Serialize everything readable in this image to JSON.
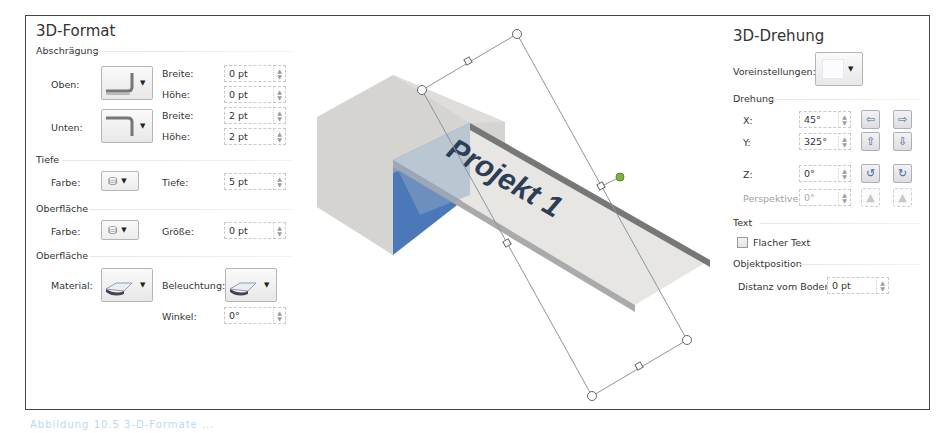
{
  "left_panel": {
    "title": "3D-Format",
    "bevel": {
      "section": "Abschrägung",
      "top_label": "Oben:",
      "bottom_label": "Unten:",
      "top_width_label": "Breite:",
      "top_width_value": "0 pt",
      "top_height_label": "Höhe:",
      "top_height_value": "0 pt",
      "bottom_width_label": "Breite:",
      "bottom_width_value": "2 pt",
      "bottom_height_label": "Höhe:",
      "bottom_height_value": "2 pt"
    },
    "depth": {
      "section": "Tiefe",
      "color_label": "Farbe:",
      "depth_label": "Tiefe:",
      "depth_value": "5 pt"
    },
    "contour": {
      "section": "Oberfläche",
      "color_label": "Farbe:",
      "size_label": "Größe:",
      "size_value": "0 pt"
    },
    "surface": {
      "section": "Oberfläche",
      "material_label": "Material:",
      "lighting_label": "Beleuchtung:",
      "angle_label": "Winkel:",
      "angle_value": "0°"
    }
  },
  "preview": {
    "text": "Projekt 1",
    "colors": {
      "cube": "#d8d6d3",
      "blue": "#4a78b8",
      "ramp": "#e9e7e4",
      "text": "#2d3d55",
      "handle": "#7cb342"
    }
  },
  "right_panel": {
    "title": "3D-Drehung",
    "presets_label": "Voreinstellungen:",
    "rotation": {
      "section": "Drehung",
      "x_label": "X:",
      "x_value": "45°",
      "y_label": "Y:",
      "y_value": "325°",
      "z_label": "Z:",
      "z_value": "0°",
      "perspective_label": "Perspektive:",
      "perspective_value": "0°",
      "icons": {
        "x_left": "⇦",
        "x_right": "⇨",
        "y_up": "⇧",
        "y_down": "⇩",
        "z_ccw": "↺",
        "z_cw": "↻",
        "persp_narrow": "▲",
        "persp_wide": "▲"
      }
    },
    "text": {
      "section": "Text",
      "flat_text_label": "Flacher Text",
      "flat_text_checked": false
    },
    "position": {
      "section": "Objektposition",
      "distance_label": "Distanz vom Boden:",
      "distance_value": "0 pt"
    }
  },
  "caption": "Abbildung 10.5 3-D-Formate ..."
}
